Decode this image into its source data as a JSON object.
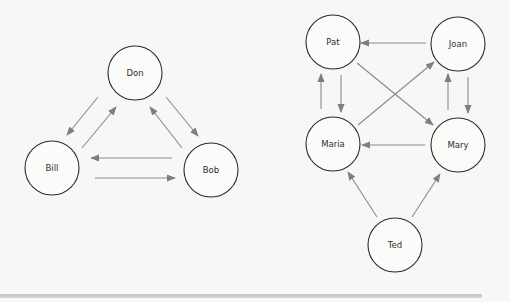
{
  "colors": {
    "background": "#f7f7f5",
    "node_stroke": "#2b2b2b",
    "edge": "#8a8a8a",
    "arrowhead": "#7e7e7e",
    "rule": "#9a9a9a"
  },
  "graphs": [
    {
      "id": "left-graph",
      "nodes": [
        {
          "id": "don",
          "label": "Don",
          "cx": 135,
          "cy": 73,
          "r": 27
        },
        {
          "id": "bill",
          "label": "Bill",
          "cx": 52,
          "cy": 168,
          "r": 27
        },
        {
          "id": "bob",
          "label": "Bob",
          "cx": 211,
          "cy": 170,
          "r": 27
        }
      ],
      "edges": [
        {
          "from": "Don",
          "to": "Bill",
          "x1": 98,
          "y1": 97,
          "x2": 67,
          "y2": 135
        },
        {
          "from": "Bill",
          "to": "Don",
          "x1": 82,
          "y1": 148,
          "x2": 116,
          "y2": 107
        },
        {
          "from": "Don",
          "to": "Bob",
          "x1": 166,
          "y1": 97,
          "x2": 198,
          "y2": 136
        },
        {
          "from": "Bob",
          "to": "Don",
          "x1": 182,
          "y1": 148,
          "x2": 150,
          "y2": 107
        },
        {
          "from": "Bob",
          "to": "Bill",
          "x1": 172,
          "y1": 158,
          "x2": 91,
          "y2": 158
        },
        {
          "from": "Bill",
          "to": "Bob",
          "x1": 95,
          "y1": 178,
          "x2": 175,
          "y2": 178
        }
      ]
    },
    {
      "id": "right-graph",
      "nodes": [
        {
          "id": "pat",
          "label": "Pat",
          "cx": 333,
          "cy": 42,
          "r": 27
        },
        {
          "id": "joan",
          "label": "Joan",
          "cx": 458,
          "cy": 44,
          "r": 27
        },
        {
          "id": "maria",
          "label": "Maria",
          "cx": 333,
          "cy": 144,
          "r": 27
        },
        {
          "id": "mary",
          "label": "Mary",
          "cx": 458,
          "cy": 145,
          "r": 27
        },
        {
          "id": "ted",
          "label": "Ted",
          "cx": 395,
          "cy": 245,
          "r": 27
        }
      ],
      "edges": [
        {
          "from": "Joan",
          "to": "Pat",
          "x1": 426,
          "y1": 43,
          "x2": 361,
          "y2": 43
        },
        {
          "from": "Maria",
          "to": "Pat",
          "x1": 321,
          "y1": 109,
          "x2": 321,
          "y2": 74
        },
        {
          "from": "Pat",
          "to": "Maria",
          "x1": 341,
          "y1": 75,
          "x2": 341,
          "y2": 112
        },
        {
          "from": "Mary",
          "to": "Joan",
          "x1": 448,
          "y1": 110,
          "x2": 448,
          "y2": 74
        },
        {
          "from": "Joan",
          "to": "Mary",
          "x1": 468,
          "y1": 77,
          "x2": 468,
          "y2": 113
        },
        {
          "from": "Pat",
          "to": "Mary",
          "x1": 357,
          "y1": 63,
          "x2": 433,
          "y2": 125
        },
        {
          "from": "Maria",
          "to": "Joan",
          "x1": 358,
          "y1": 125,
          "x2": 434,
          "y2": 62
        },
        {
          "from": "Mary",
          "to": "Maria",
          "x1": 425,
          "y1": 145,
          "x2": 362,
          "y2": 145
        },
        {
          "from": "Ted",
          "to": "Maria",
          "x1": 377,
          "y1": 217,
          "x2": 348,
          "y2": 172
        },
        {
          "from": "Ted",
          "to": "Mary",
          "x1": 412,
          "y1": 217,
          "x2": 440,
          "y2": 174
        }
      ]
    }
  ],
  "footer_rule": {
    "x1": 0,
    "x2": 482,
    "y1": 295,
    "y2": 297
  }
}
